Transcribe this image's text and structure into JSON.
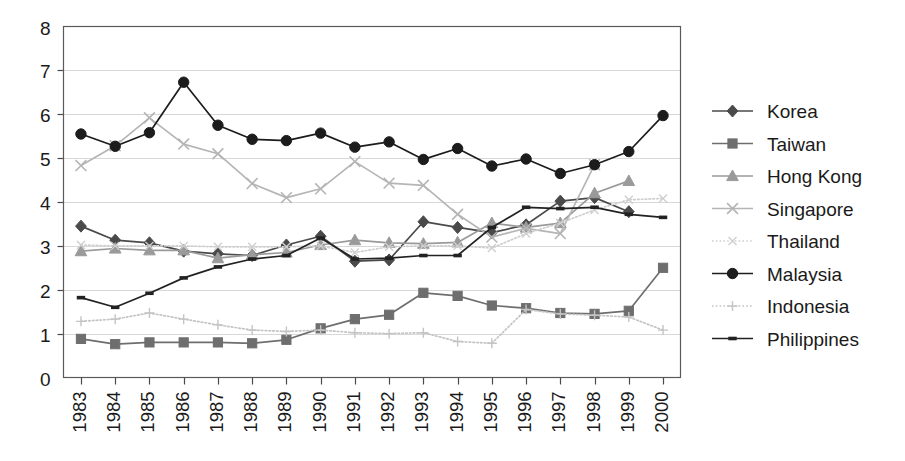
{
  "chart_data": {
    "type": "line",
    "title": "",
    "subtitle": "",
    "xlabel": "",
    "ylabel": "",
    "xlim": [
      1983,
      2000
    ],
    "ylim": [
      0,
      8
    ],
    "ytick_step": 1,
    "grid": true,
    "legend_position": "right",
    "categories": [
      1983,
      1984,
      1985,
      1986,
      1987,
      1988,
      1989,
      1990,
      1991,
      1992,
      1993,
      1994,
      1995,
      1996,
      1997,
      1998,
      1999,
      2000
    ],
    "xtick_labels": [
      "1983",
      "1984",
      "1985",
      "1986",
      "1987",
      "1988",
      "1989",
      "1990",
      "1991",
      "1992",
      "1993",
      "1994",
      "1995",
      "1996",
      "1997",
      "1998",
      "1999",
      "2000"
    ],
    "ytick_labels": [
      "0",
      "1",
      "2",
      "3",
      "4",
      "5",
      "6",
      "7",
      "8"
    ],
    "series": [
      {
        "name": "Korea",
        "marker": "diamond",
        "color": "#4a4a4a",
        "line_style": "solid",
        "values": [
          3.45,
          3.13,
          3.07,
          2.88,
          2.82,
          2.78,
          3.02,
          3.22,
          2.65,
          2.68,
          3.55,
          3.42,
          3.3,
          3.48,
          4.02,
          4.1,
          3.78,
          null
        ]
      },
      {
        "name": "Taiwan",
        "marker": "square",
        "color": "#6e6e6e",
        "line_style": "solid",
        "values": [
          0.88,
          0.76,
          0.8,
          0.8,
          0.8,
          0.78,
          0.86,
          1.12,
          1.33,
          1.43,
          1.93,
          1.86,
          1.64,
          1.58,
          1.47,
          1.45,
          1.52,
          2.5
        ]
      },
      {
        "name": "Hong Kong",
        "marker": "triangle",
        "color": "#9a9a9a",
        "line_style": "solid",
        "values": [
          2.88,
          2.94,
          2.9,
          2.9,
          2.72,
          2.8,
          2.85,
          3.02,
          3.13,
          3.07,
          3.05,
          3.08,
          3.52,
          3.42,
          3.52,
          4.2,
          4.48,
          null
        ]
      },
      {
        "name": "Singapore",
        "marker": "cross",
        "color": "#b5b5b5",
        "line_style": "solid",
        "values": [
          4.83,
          5.28,
          5.92,
          5.32,
          5.1,
          4.42,
          4.1,
          4.3,
          4.92,
          4.43,
          4.38,
          3.72,
          3.2,
          3.4,
          3.28,
          4.85,
          null,
          null
        ]
      },
      {
        "name": "Thailand",
        "marker": "cross-small",
        "color": "#cfcfcf",
        "line_style": "dotted",
        "values": [
          3.02,
          3.0,
          3.0,
          3.0,
          2.98,
          2.98,
          2.98,
          3.0,
          2.85,
          2.98,
          3.0,
          3.0,
          2.95,
          3.28,
          3.52,
          3.82,
          4.05,
          4.08
        ]
      },
      {
        "name": "Malaysia",
        "marker": "circle",
        "color": "#1c1c1c",
        "line_style": "solid",
        "values": [
          5.55,
          5.27,
          5.58,
          6.73,
          5.75,
          5.43,
          5.4,
          5.57,
          5.25,
          5.37,
          4.97,
          5.22,
          4.82,
          4.98,
          4.65,
          4.85,
          5.15,
          5.97
        ]
      },
      {
        "name": "Indonesia",
        "marker": "plus",
        "color": "#c4c4c4",
        "line_style": "dotted",
        "values": [
          1.28,
          1.33,
          1.47,
          1.33,
          1.2,
          1.08,
          1.05,
          1.08,
          1.02,
          1.0,
          1.02,
          0.82,
          0.78,
          1.55,
          1.45,
          1.42,
          1.38,
          1.08
        ]
      },
      {
        "name": "Philippines",
        "marker": "dash",
        "color": "#222222",
        "line_style": "solid",
        "values": [
          1.82,
          1.6,
          1.92,
          2.27,
          2.52,
          2.7,
          2.78,
          3.18,
          2.7,
          2.72,
          2.78,
          2.78,
          3.42,
          3.88,
          3.85,
          3.88,
          3.72,
          3.65
        ]
      }
    ]
  },
  "legend": {
    "items": [
      {
        "label": "Korea"
      },
      {
        "label": "Taiwan"
      },
      {
        "label": "Hong Kong"
      },
      {
        "label": "Singapore"
      },
      {
        "label": "Thailand"
      },
      {
        "label": "Malaysia"
      },
      {
        "label": "Indonesia"
      },
      {
        "label": "Philippines"
      }
    ]
  }
}
